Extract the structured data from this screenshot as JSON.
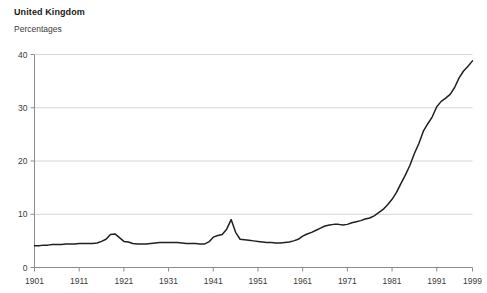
{
  "header": {
    "title": "United Kingdom",
    "subtitle": "Percentages"
  },
  "chart_data": {
    "type": "line",
    "title": "United Kingdom",
    "subtitle": "Percentages",
    "xlabel": "",
    "ylabel": "Percentages",
    "xlim": [
      1901,
      1999
    ],
    "ylim": [
      0,
      40
    ],
    "grid": "horizontal",
    "legend": "none",
    "line_color": "#231f20",
    "grid_color": "#d5d5d5",
    "axis_color": "#8c8c8c",
    "background": "#ffffff",
    "y_ticks": [
      0,
      10,
      20,
      30,
      40
    ],
    "y_tick_labels": [
      "0",
      "10",
      "20",
      "30",
      "40"
    ],
    "x_ticks": [
      1901,
      1911,
      1921,
      1931,
      1941,
      1951,
      1961,
      1971,
      1981,
      1991,
      1999
    ],
    "x_tick_labels": [
      "1901",
      "1911",
      "1921",
      "1931",
      "1941",
      "1951",
      "1961",
      "1971",
      "1981",
      "1991",
      "1999"
    ],
    "series": [
      {
        "name": "United Kingdom",
        "x": [
          1901,
          1902,
          1903,
          1904,
          1905,
          1906,
          1907,
          1908,
          1909,
          1910,
          1911,
          1912,
          1913,
          1914,
          1915,
          1916,
          1917,
          1918,
          1919,
          1920,
          1921,
          1922,
          1923,
          1924,
          1925,
          1926,
          1927,
          1928,
          1929,
          1930,
          1931,
          1932,
          1933,
          1934,
          1935,
          1936,
          1937,
          1938,
          1939,
          1940,
          1941,
          1942,
          1943,
          1944,
          1945,
          1946,
          1947,
          1948,
          1949,
          1950,
          1951,
          1952,
          1953,
          1954,
          1955,
          1956,
          1957,
          1958,
          1959,
          1960,
          1961,
          1962,
          1963,
          1964,
          1965,
          1966,
          1967,
          1968,
          1969,
          1970,
          1971,
          1972,
          1973,
          1974,
          1975,
          1976,
          1977,
          1978,
          1979,
          1980,
          1981,
          1982,
          1983,
          1984,
          1985,
          1986,
          1987,
          1988,
          1989,
          1990,
          1991,
          1992,
          1993,
          1994,
          1995,
          1996,
          1997,
          1998,
          1999
        ],
        "values": [
          4.1,
          4.1,
          4.2,
          4.2,
          4.3,
          4.3,
          4.3,
          4.4,
          4.4,
          4.4,
          4.5,
          4.5,
          4.5,
          4.5,
          4.6,
          4.9,
          5.3,
          6.2,
          6.3,
          5.6,
          4.9,
          4.8,
          4.5,
          4.4,
          4.4,
          4.4,
          4.5,
          4.6,
          4.7,
          4.7,
          4.7,
          4.7,
          4.7,
          4.6,
          4.5,
          4.5,
          4.5,
          4.4,
          4.4,
          4.8,
          5.7,
          6.0,
          6.2,
          7.2,
          9.0,
          6.6,
          5.3,
          5.2,
          5.1,
          5.0,
          4.9,
          4.8,
          4.7,
          4.7,
          4.6,
          4.6,
          4.7,
          4.8,
          5.0,
          5.3,
          5.9,
          6.3,
          6.6,
          7.0,
          7.4,
          7.8,
          8.0,
          8.1,
          8.1,
          8.0,
          8.1,
          8.4,
          8.6,
          8.8,
          9.1,
          9.3,
          9.7,
          10.3,
          10.9,
          11.8,
          12.8,
          14.1,
          15.8,
          17.4,
          19.2,
          21.4,
          23.3,
          25.6,
          27.0,
          28.3,
          30.2,
          31.2,
          31.8,
          32.5,
          33.8,
          35.6,
          36.9,
          37.8,
          38.8
        ]
      }
    ]
  }
}
